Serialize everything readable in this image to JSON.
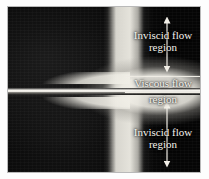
{
  "figure": {
    "type": "flow-visualization-photograph",
    "background_color": "#050505",
    "annotation_color": "#f4f2ec",
    "page_background": "#ffffff"
  },
  "annotations": {
    "inviscid_top": {
      "line1": "Inviscid flow",
      "line2": "region",
      "arrow": "double-headed-vertical-arrow"
    },
    "viscous_middle": {
      "line1": "Viscous flow",
      "line2": "region",
      "bounding_rule_top": "horizontal-rule",
      "bounding_rule_bottom": "horizontal-rule"
    },
    "inviscid_bottom": {
      "line1": "Inviscid flow",
      "line2": "region",
      "arrow": "double-headed-vertical-arrow"
    }
  },
  "flow_features": {
    "plate": "flat-plate-centerline",
    "upper_shear_layer": "boundary-layer-growth-upper",
    "lower_shear_layer": "boundary-layer-growth-lower",
    "bright_plume": "downstream-luminous-region"
  }
}
